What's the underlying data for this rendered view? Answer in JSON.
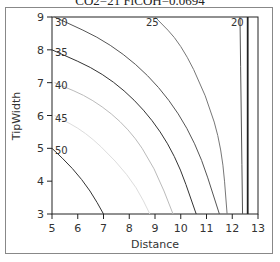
{
  "chart_data": {
    "type": "contour",
    "title": "CO2=21 FiCOH=0.0694",
    "xlabel": "Distance",
    "ylabel": "TipWidth",
    "xlim": [
      5,
      13
    ],
    "ylim": [
      3,
      9
    ],
    "x_ticks": [
      "5",
      "6",
      "7",
      "8",
      "9",
      "10",
      "11",
      "12",
      "13"
    ],
    "y_ticks": [
      "3",
      "4",
      "5",
      "6",
      "7",
      "8",
      "9"
    ],
    "grid": false,
    "contours": [
      {
        "level": "50",
        "points": [
          [
            5.0,
            5.0
          ],
          [
            5.8,
            4.4
          ],
          [
            6.5,
            3.7
          ],
          [
            7.0,
            3.0
          ]
        ]
      },
      {
        "level": "45",
        "points": [
          [
            5.1,
            6.0
          ],
          [
            6.3,
            5.5
          ],
          [
            7.5,
            4.6
          ],
          [
            8.3,
            3.8
          ],
          [
            8.8,
            3.0
          ]
        ]
      },
      {
        "level": "40",
        "points": [
          [
            5.1,
            7.0
          ],
          [
            6.6,
            6.5
          ],
          [
            8.0,
            5.6
          ],
          [
            9.0,
            4.4
          ],
          [
            9.7,
            3.0
          ]
        ]
      },
      {
        "level": "35",
        "points": [
          [
            5.0,
            8.0
          ],
          [
            7.0,
            7.3
          ],
          [
            8.6,
            6.2
          ],
          [
            9.8,
            4.8
          ],
          [
            10.6,
            3.0
          ]
        ]
      },
      {
        "level": "30",
        "points": [
          [
            5.1,
            9.0
          ],
          [
            7.3,
            8.2
          ],
          [
            9.2,
            6.9
          ],
          [
            10.6,
            5.2
          ],
          [
            11.5,
            3.0
          ]
        ]
      },
      {
        "level": "25",
        "points": [
          [
            9.0,
            9.0
          ],
          [
            10.0,
            8.2
          ],
          [
            11.0,
            6.6
          ],
          [
            11.6,
            5.0
          ],
          [
            11.8,
            3.0
          ]
        ]
      },
      {
        "level": "20",
        "points": [
          [
            12.3,
            9.0
          ],
          [
            12.35,
            6.0
          ],
          [
            12.4,
            3.0
          ]
        ]
      },
      {
        "level": "",
        "points": [
          [
            12.6,
            9.0
          ],
          [
            12.6,
            3.0
          ]
        ]
      }
    ]
  },
  "labels": {
    "title": "CO2=21 FiCOH=0.0694",
    "xlabel": "Distance",
    "ylabel": "TipWidth",
    "contour_labels": [
      "30",
      "35",
      "40",
      "45",
      "50",
      "25",
      "20"
    ]
  }
}
